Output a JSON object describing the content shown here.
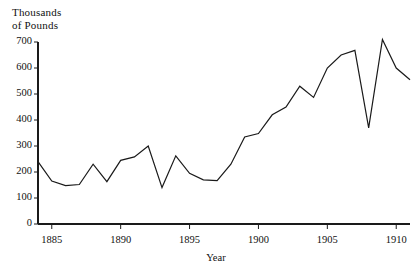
{
  "chart_data": {
    "type": "line",
    "title": "",
    "ylabel": "Thousands\nof Pounds",
    "xlabel": "Year",
    "grid": false,
    "legend": "none",
    "xlim": [
      1884,
      1911
    ],
    "ylim": [
      0,
      700
    ],
    "y_ticks": [
      0,
      100,
      200,
      300,
      400,
      500,
      600,
      700
    ],
    "y_tick_labels": [
      "0",
      "100",
      "200",
      "300",
      "400",
      "500",
      "600",
      "700"
    ],
    "x_ticks": [
      1885,
      1890,
      1895,
      1900,
      1905,
      1910
    ],
    "x_tick_labels": [
      "1885",
      "1890",
      "1895",
      "1900",
      "1905",
      "1910"
    ],
    "line_color": "#1a1a1a",
    "x": [
      1884,
      1885,
      1886,
      1887,
      1888,
      1889,
      1890,
      1891,
      1892,
      1893,
      1894,
      1895,
      1896,
      1897,
      1898,
      1899,
      1900,
      1901,
      1902,
      1903,
      1904,
      1905,
      1906,
      1907,
      1908,
      1909,
      1910,
      1911
    ],
    "values": [
      240,
      165,
      148,
      152,
      230,
      163,
      245,
      258,
      300,
      140,
      262,
      195,
      170,
      167,
      230,
      335,
      348,
      420,
      450,
      530,
      487,
      600,
      650,
      668,
      370,
      710,
      600,
      555
    ],
    "series": [
      {
        "name": "",
        "values": [
          240,
          165,
          148,
          152,
          230,
          163,
          245,
          258,
          300,
          140,
          262,
          195,
          170,
          167,
          230,
          335,
          348,
          420,
          450,
          530,
          487,
          600,
          650,
          668,
          370,
          710,
          600,
          555
        ]
      }
    ]
  },
  "axis": {
    "y_title": "Thousands\nof Pounds",
    "x_title": "Year"
  }
}
